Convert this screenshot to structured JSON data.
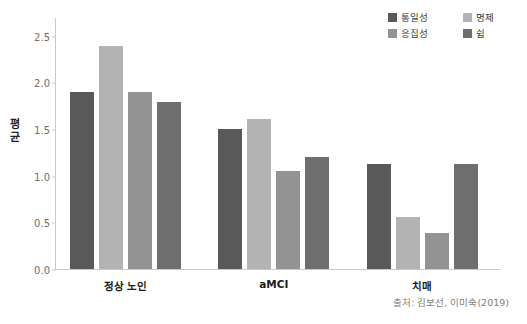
{
  "chart_data": {
    "type": "bar",
    "title": "",
    "xlabel": "",
    "ylabel": "평균",
    "ylim": [
      0,
      2.7
    ],
    "yticks": [
      "0.0",
      "0.5",
      "1.0",
      "1.5",
      "2.0",
      "2.5"
    ],
    "ytick_values": [
      0.0,
      0.5,
      1.0,
      1.5,
      2.0,
      2.5
    ],
    "grid": false,
    "legend_position": "top-right",
    "categories": [
      "정상 노인",
      "aMCI",
      "치매"
    ],
    "series": [
      {
        "name": "통일성",
        "color": "#595959",
        "values": [
          1.9,
          1.5,
          1.12
        ]
      },
      {
        "name": "명제",
        "color": "#b3b3b3",
        "values": [
          2.39,
          1.61,
          0.56
        ]
      },
      {
        "name": "응집성",
        "color": "#939393",
        "values": [
          1.9,
          1.05,
          0.39
        ]
      },
      {
        "name": "쉼",
        "color": "#6e6e6e",
        "values": [
          1.79,
          1.2,
          1.12
        ]
      }
    ],
    "annotations": [
      "출처: 김보선, 이미숙(2019)"
    ]
  },
  "legend": {
    "entries": [
      {
        "label": "통일성",
        "color": "#595959"
      },
      {
        "label": "명제",
        "color": "#b3b3b3"
      },
      {
        "label": "응집성",
        "color": "#939393"
      },
      {
        "label": "쉼",
        "color": "#6e6e6e"
      }
    ]
  },
  "source": {
    "text": "출처: 김보선, 이미숙(2019)"
  },
  "colors": {
    "axis": "#c9c9c9",
    "tick_text": "#6f6f6f",
    "category_text": "#1c1c1c",
    "axis_title": "#1f1f1f",
    "source_text": "#808080",
    "background": "#ffffff"
  }
}
